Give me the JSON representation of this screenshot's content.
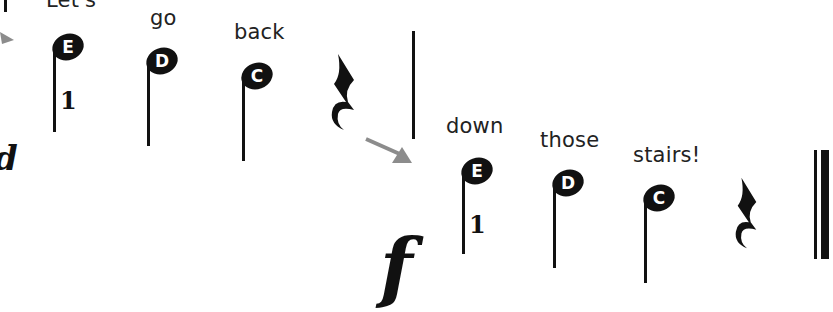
{
  "lines": [
    {
      "lyrics": [
        "Let's",
        "go",
        "back"
      ],
      "notes": [
        {
          "letter": "E",
          "finger": "1"
        },
        {
          "letter": "D",
          "finger": ""
        },
        {
          "letter": "C",
          "finger": ""
        }
      ],
      "rest": "quarter-rest",
      "dynamic": "d"
    },
    {
      "lyrics": [
        "down",
        "those",
        "stairs!"
      ],
      "notes": [
        {
          "letter": "E",
          "finger": "1"
        },
        {
          "letter": "D",
          "finger": ""
        },
        {
          "letter": "C",
          "finger": ""
        }
      ],
      "rest": "quarter-rest",
      "dynamic": "f"
    }
  ],
  "colors": {
    "ink": "#111111",
    "arrow": "#8c8c8c",
    "background": "#ffffff"
  }
}
